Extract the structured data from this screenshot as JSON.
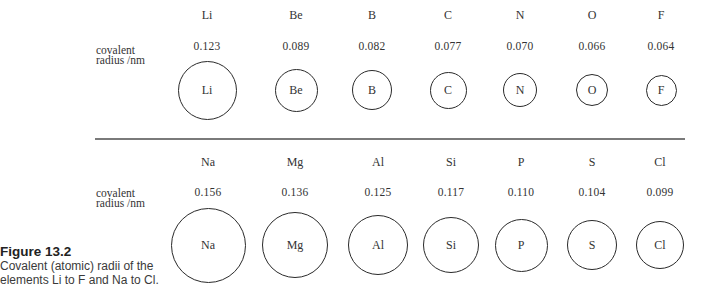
{
  "figure": {
    "number": "Figure 13.2",
    "caption_line1": "Covalent (atomic) radii of the",
    "caption_line2": "elements Li to F and Na to Cl."
  },
  "row_label": {
    "line1": "covalent",
    "line2": "radius /nm"
  },
  "rows": [
    {
      "period": 2,
      "elements": [
        {
          "symbol": "Li",
          "radius": "0.123",
          "cx": 207
        },
        {
          "symbol": "Be",
          "radius": "0.089",
          "cx": 296
        },
        {
          "symbol": "B",
          "radius": "0.082",
          "cx": 372
        },
        {
          "symbol": "C",
          "radius": "0.077",
          "cx": 448
        },
        {
          "symbol": "N",
          "radius": "0.070",
          "cx": 520
        },
        {
          "symbol": "O",
          "radius": "0.066",
          "cx": 592
        },
        {
          "symbol": "F",
          "radius": "0.064",
          "cx": 661
        }
      ]
    },
    {
      "period": 3,
      "elements": [
        {
          "symbol": "Na",
          "radius": "0.156",
          "cx": 208
        },
        {
          "symbol": "Mg",
          "radius": "0.136",
          "cx": 295
        },
        {
          "symbol": "Al",
          "radius": "0.125",
          "cx": 378
        },
        {
          "symbol": "Si",
          "radius": "0.117",
          "cx": 451
        },
        {
          "symbol": "P",
          "radius": "0.110",
          "cx": 521
        },
        {
          "symbol": "S",
          "radius": "0.104",
          "cx": 592
        },
        {
          "symbol": "Cl",
          "radius": "0.099",
          "cx": 660
        }
      ]
    }
  ]
}
